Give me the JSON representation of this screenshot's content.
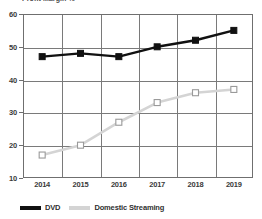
{
  "chart_data": {
    "type": "line",
    "title": "Profit Margin %",
    "xlabel": "",
    "ylabel": "",
    "categories": [
      "2014",
      "2015",
      "2016",
      "2017",
      "2018",
      "2019"
    ],
    "x": [
      2014,
      2015,
      2016,
      2017,
      2018,
      2019
    ],
    "ylim": [
      10,
      60
    ],
    "yticks": [
      10,
      20,
      30,
      40,
      50,
      60
    ],
    "ytick_labels": [
      "10",
      "20",
      "30",
      "40",
      "50",
      "60"
    ],
    "grid": true,
    "legend_position": "bottom-left",
    "series": [
      {
        "name": "DVD",
        "values": [
          47,
          48,
          47,
          50,
          52,
          55
        ],
        "color": "#111111",
        "marker": "filled-square"
      },
      {
        "name": "Domestic Streaming",
        "values": [
          17,
          20,
          27,
          33,
          36,
          37
        ],
        "color": "#d4d4d4",
        "marker": "open-square"
      }
    ]
  },
  "legend": {
    "items": [
      {
        "label": "DVD",
        "color": "#111111"
      },
      {
        "label": "Domestic Streaming",
        "color": "#d4d4d4"
      }
    ]
  }
}
